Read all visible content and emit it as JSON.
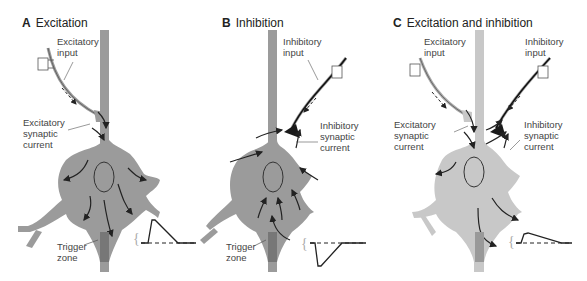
{
  "figure": {
    "panels": [
      {
        "letter": "A",
        "title": "Excitation",
        "labels": {
          "input": "Excitatory\ninput",
          "synaptic_current": "Excitatory\nsynaptic\ncurrent",
          "trigger_zone": "Trigger\nzone"
        },
        "cell_color": "#9b9b9b",
        "trace": "depolarizing (EPSP)"
      },
      {
        "letter": "B",
        "title": "Inhibition",
        "labels": {
          "input": "Inhibitory\ninput",
          "synaptic_current": "Inhibitory\nsynaptic\ncurrent",
          "trigger_zone": "Trigger\nzone"
        },
        "cell_color": "#9b9b9b",
        "trace": "hyperpolarizing (IPSP)"
      },
      {
        "letter": "C",
        "title": "Excitation and inhibition",
        "labels": {
          "excitatory_input": "Excitatory\ninput",
          "inhibitory_input": "Inhibitory\ninput",
          "excitatory_current": "Excitatory\nsynaptic\ncurrent",
          "inhibitory_current": "Inhibitory\nsynaptic\ncurrent"
        },
        "cell_color": "#c8c8c8",
        "trace": "reduced depolarization"
      }
    ],
    "colors": {
      "text": "#444444",
      "arrow": "#222222",
      "electrode": "#555555",
      "inhibitory_terminal": "#1a1a1a"
    }
  }
}
